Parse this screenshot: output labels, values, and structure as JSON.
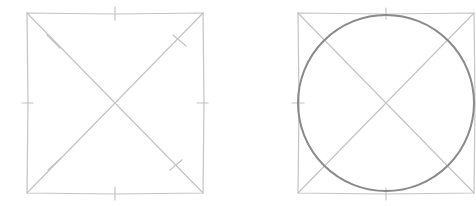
{
  "figures": [
    {
      "id": "square-with-diagonals",
      "square": {
        "x1": 27,
        "y1": 13,
        "x2": 203,
        "y2": 193
      },
      "stroke": "#c4c4c4",
      "has_circle": false
    },
    {
      "id": "square-with-inscribed-circle",
      "square": {
        "x1": 298,
        "y1": 13,
        "x2": 474,
        "y2": 193
      },
      "circle": {
        "cx": 386,
        "cy": 103,
        "r": 88
      },
      "stroke": "#c4c4c4",
      "circle_stroke": "#8a8a8a",
      "has_circle": true
    }
  ],
  "colors": {
    "background": "#ffffff",
    "guide": "#c4c4c4",
    "circle": "#8a8a8a"
  }
}
